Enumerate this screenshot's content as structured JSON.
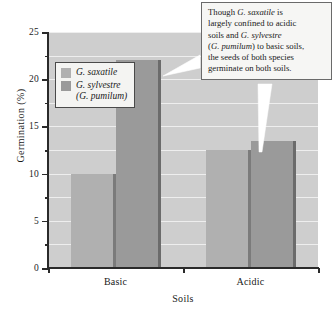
{
  "chart_data": {
    "type": "bar",
    "title": "",
    "xlabel": "Soils",
    "ylabel": "Germination (%)",
    "categories": [
      "Basic",
      "Acidic"
    ],
    "ylim": [
      0,
      25
    ],
    "y_ticks": [
      0,
      5,
      10,
      15,
      20,
      25
    ],
    "y_tick_labels": [
      "0",
      "5",
      "10",
      "15",
      "20",
      "25"
    ],
    "y_minor_ticks": [
      2.5,
      7.5,
      12.5,
      17.5,
      22.5
    ],
    "grid": true,
    "legend_position": "upper-left-inside",
    "series": [
      {
        "name": "G. saxatile",
        "color": "#b0b0b0",
        "values": [
          10.0,
          12.5
        ]
      },
      {
        "name": "G. sylvestre (G. pumilum)",
        "color": "#9a9a9a",
        "values": [
          22.0,
          13.5
        ]
      }
    ]
  },
  "axes": {
    "y_title": "Germination  (%)",
    "x_title": "Soils",
    "y_labels": [
      "25",
      "20",
      "15",
      "10",
      "5",
      "0"
    ],
    "x_labels": [
      "Basic",
      "Acidic"
    ]
  },
  "legend": {
    "entries": [
      {
        "label": "G. saxatile",
        "sublabel": "",
        "color": "#b0b0b0"
      },
      {
        "label": "G. sylvestre",
        "sublabel": "(G. pumilum)",
        "color": "#9a9a9a"
      }
    ]
  },
  "callout": {
    "text": "Though G. saxatile is largely confined to acidic soils and G. sylvestre (G. pumilum) to basic soils, the seeds of both species germinate on both soils.",
    "lines": [
      "Though G. saxatile is",
      "largely confined to acidic",
      "soils and G. sylvestre",
      "(G. pumilum) to basic soils,",
      "the seeds of both species",
      "germinate on both soils."
    ]
  },
  "colors": {
    "plot_background": "#cecece",
    "gridline": "#eeeeee",
    "axis": "#2a2a2a",
    "series_light": "#b0b0b0",
    "series_dark": "#9a9a9a",
    "callout_background": "#f6f6f4",
    "callout_border": "#6a6a6a"
  }
}
